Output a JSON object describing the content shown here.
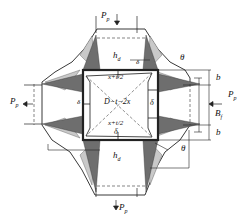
{
  "diagram": {
    "type": "structural cross-section with deformation mechanism",
    "colors": {
      "line": "#222222",
      "dark_fill": "#6e6e6e",
      "light_fill": "#c4c4c4",
      "background": "#ffffff"
    },
    "labels": {
      "load_top": "P",
      "load_top_sub": "p",
      "load_bottom": "P",
      "load_bottom_sub": "p",
      "load_left": "P",
      "load_left_sub": "p",
      "load_right": "P",
      "load_right_sub": "p",
      "h_top": "h",
      "h_top_sub": "d",
      "h_bottom": "h",
      "h_bottom_sub": "d",
      "theta_top": "θ",
      "theta_bottom": "θ",
      "b_top": "b",
      "b_bottom": "b",
      "bf": "B",
      "bf_sub": "f",
      "x_t2_top": "x+t/2",
      "x_t2_bottom": "x+t/2",
      "center": "D−t−2x",
      "delta_left": "δ",
      "delta_right": "δ",
      "delta_bottom": "δ",
      "delta_top": "δ"
    }
  }
}
